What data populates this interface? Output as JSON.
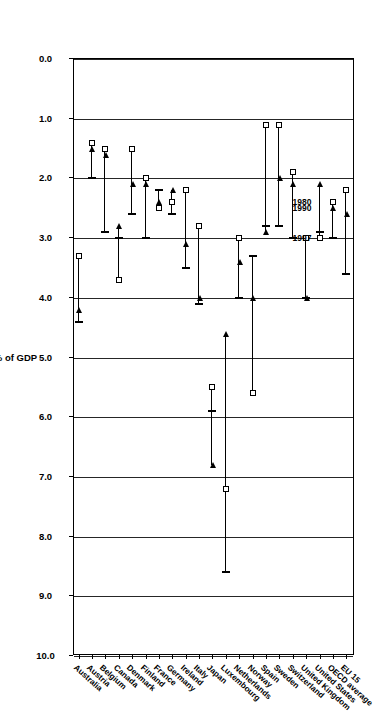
{
  "chart_data": {
    "type": "scatter",
    "title": "",
    "xlabel": "",
    "ylabel": "% of GDP",
    "ylim": [
      0.0,
      10.0
    ],
    "ytick_labels": [
      "0.0",
      "1.0",
      "2.0",
      "3.0",
      "4.0",
      "5.0",
      "6.0",
      "7.0",
      "8.0",
      "9.0",
      "10.0"
    ],
    "ytick_values": [
      0.0,
      1.0,
      2.0,
      3.0,
      4.0,
      5.0,
      6.0,
      7.0,
      8.0,
      9.0,
      10.0
    ],
    "grid": true,
    "legend_position": "inside-plot-near-oecd-average",
    "categories": [
      "Australia",
      "Austria",
      "Belgium",
      "Canada",
      "Denmark",
      "Finland",
      "France",
      "Germany",
      "Ireland",
      "Italy",
      "Japan",
      "Luxembourg",
      "Netherlands",
      "Norway",
      "Spain",
      "Sweden",
      "Switzerland",
      "United Kingdom",
      "United States",
      "OECD average",
      "EU 15"
    ],
    "series": [
      {
        "name": "1980",
        "marker": "square",
        "values": [
          3.3,
          1.4,
          1.5,
          3.7,
          1.5,
          2.0,
          2.5,
          2.4,
          2.2,
          2.8,
          5.5,
          7.2,
          3.0,
          5.6,
          1.1,
          1.1,
          1.9,
          3.0,
          3.0,
          2.4,
          2.2
        ]
      },
      {
        "name": "1990",
        "marker": "triangle",
        "values": [
          4.2,
          1.5,
          1.6,
          2.8,
          2.1,
          2.1,
          2.4,
          2.2,
          3.1,
          4.0,
          6.8,
          4.6,
          3.4,
          4.0,
          2.9,
          2.0,
          2.1,
          4.0,
          2.1,
          2.5,
          2.6
        ]
      },
      {
        "name": "1997",
        "marker": "bar",
        "values": [
          4.4,
          2.0,
          2.9,
          3.0,
          2.6,
          3.0,
          2.2,
          2.6,
          3.5,
          4.1,
          5.9,
          8.6,
          4.0,
          3.3,
          2.8,
          2.8,
          3.0,
          4.0,
          2.9,
          3.0,
          3.6
        ]
      }
    ],
    "legend_entries": [
      {
        "label": "1997",
        "marker": "bar"
      },
      {
        "label": "1990",
        "marker": "triangle"
      },
      {
        "label": "1980",
        "marker": "square"
      }
    ]
  }
}
